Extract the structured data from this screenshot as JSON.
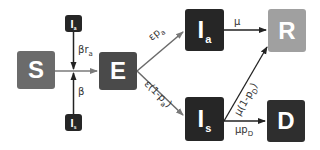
{
  "diagram": {
    "type": "compartmental-model",
    "nodes": [
      {
        "id": "S",
        "label": "S",
        "color": "#6b6b6b"
      },
      {
        "id": "E",
        "label": "E",
        "color": "#4a4a4a"
      },
      {
        "id": "Ia",
        "label": "I",
        "sub": "a",
        "color": "#262626"
      },
      {
        "id": "Is",
        "label": "I",
        "sub": "s",
        "color": "#262626"
      },
      {
        "id": "R",
        "label": "R",
        "color": "#a0a0a0"
      },
      {
        "id": "D",
        "label": "D",
        "color": "#2e2e2e"
      },
      {
        "id": "Ia_src",
        "label": "I",
        "sub": "a",
        "color": "#262626"
      },
      {
        "id": "Is_src",
        "label": "I",
        "sub": "s",
        "color": "#262626"
      }
    ],
    "edges": [
      {
        "from": "S",
        "to": "E",
        "label": ""
      },
      {
        "from": "Ia_src",
        "to": "S-E",
        "label_main": "βr",
        "label_sub": "a"
      },
      {
        "from": "Is_src",
        "to": "S-E",
        "label_main": "β",
        "label_sub": ""
      },
      {
        "from": "E",
        "to": "Ia",
        "label_main": "εp",
        "label_sub": "a"
      },
      {
        "from": "E",
        "to": "Is",
        "label_main": "ε(1-p",
        "label_sub": "a",
        "label_tail": ")"
      },
      {
        "from": "Ia",
        "to": "R",
        "label_main": "μ",
        "label_sub": ""
      },
      {
        "from": "Is",
        "to": "R",
        "label_main": "μ(1-p",
        "label_sub": "D",
        "label_tail": ")"
      },
      {
        "from": "Is",
        "to": "D",
        "label_main": "μp",
        "label_sub": "D"
      }
    ]
  }
}
